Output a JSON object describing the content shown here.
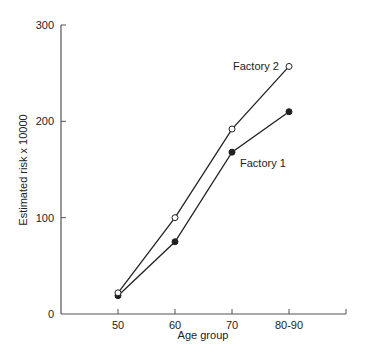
{
  "chart_data": {
    "type": "line",
    "title": "",
    "xlabel": "Age group",
    "ylabel": "Estimated risk x 10000",
    "categories": [
      "50",
      "60",
      "70",
      "80-90"
    ],
    "series": [
      {
        "name": "Factory 1",
        "marker": "filled-circle",
        "values": [
          19,
          75,
          168,
          210
        ]
      },
      {
        "name": "Factory 2",
        "marker": "open-circle",
        "values": [
          22,
          100,
          192,
          257
        ]
      }
    ],
    "ylim": [
      0,
      300
    ],
    "yticks": [
      "0",
      "100",
      "200",
      "300"
    ],
    "grid": false,
    "legend": "inline labels next to lines"
  },
  "colors": {
    "axis": "#555555",
    "line": "#222222",
    "text": "#222222"
  }
}
